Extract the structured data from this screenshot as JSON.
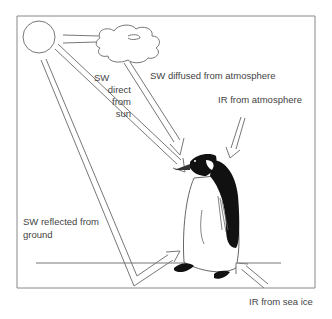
{
  "diagram": {
    "colors": {
      "line": "#777777",
      "frame": "#888888",
      "text": "#444444",
      "penguin_black": "#111111",
      "background": "#ffffff"
    },
    "nodes": [
      {
        "id": "sun",
        "shape": "circle",
        "label": ""
      },
      {
        "id": "cloud",
        "shape": "cloud",
        "label": ""
      },
      {
        "id": "penguin",
        "shape": "penguin",
        "label": ""
      },
      {
        "id": "ground",
        "shape": "line",
        "label": ""
      }
    ],
    "labels": {
      "sw_direct_line1": "SW",
      "sw_direct_line2": "direct",
      "sw_direct_line3": "from",
      "sw_direct_line4": "sun",
      "sw_diffused": "SW diffused from atmosphere",
      "ir_atmosphere": "IR from atmosphere",
      "sw_reflected_line1": "SW reflected from",
      "sw_reflected_line2": "ground",
      "ir_sea_ice": "IR from sea ice"
    },
    "edges": [
      {
        "from": "sun",
        "to": "cloud",
        "label": ""
      },
      {
        "from": "sun",
        "to": "penguin",
        "label": "SW direct from sun"
      },
      {
        "from": "cloud",
        "to": "penguin",
        "label": "SW diffused from atmosphere"
      },
      {
        "from": "atmosphere",
        "to": "penguin",
        "label": "IR from atmosphere"
      },
      {
        "from": "sun",
        "to": "ground",
        "label": "SW reflected from ground"
      },
      {
        "from": "ground",
        "to": "penguin",
        "label": ""
      },
      {
        "from": "sea-ice",
        "to": "penguin",
        "label": "IR from sea ice"
      }
    ]
  }
}
